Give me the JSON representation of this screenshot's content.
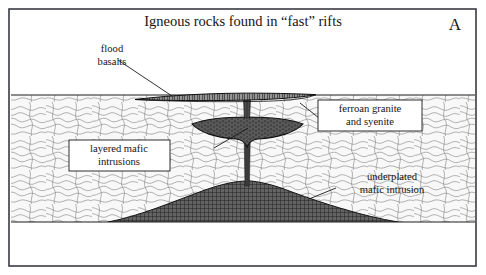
{
  "figure": {
    "title": "Igneous rocks found in “fast” rifts",
    "panel_letter": "A",
    "frame_color": "#3a3a44",
    "background_color": "#ffffff"
  },
  "labels": {
    "flood_basalts": {
      "line1": "flood",
      "line2": "basalts",
      "boxed": false
    },
    "ferroan_granite": {
      "line1": "ferroan granite",
      "line2": "and syenite",
      "boxed": true
    },
    "layered_mafic": {
      "line1": "layered mafic",
      "line2": "intrusions",
      "boxed": true
    },
    "underplated_mafic": {
      "line1": "underplated",
      "line2": "mafic intrusion",
      "boxed": false
    }
  },
  "geology": {
    "crust": {
      "name": "continental crust",
      "fill_color": "#f7f7f7",
      "pattern": "contorted-gneiss-squiggle",
      "top_y": 95,
      "bottom_y": 222
    },
    "mantle": {
      "name": "mantle",
      "fill_color": "#ffffff",
      "pattern": "none"
    },
    "flood_basalt_layer": {
      "name": "flood basalt lens",
      "fill_color": "#4a4a4a",
      "pattern": "vertical-columnar-jointing",
      "left_x": 135,
      "right_x": 316
    },
    "lopolith": {
      "name": "layered mafic intrusion (lopolith)",
      "fill_color": "#555555",
      "pattern": "stipple-layered",
      "left_x": 192,
      "right_x": 303,
      "center_x": 247,
      "top_y": 120
    },
    "feeder_dike": {
      "name": "feeder dike",
      "fill_color": "#3c3c3c"
    },
    "underplate": {
      "name": "underplated mafic intrusion",
      "fill_color": "#5a5a5a",
      "pattern": "cross-hatch-grid",
      "left_x": 108,
      "right_x": 398,
      "crest_x": 247,
      "crest_y": 184
    }
  }
}
